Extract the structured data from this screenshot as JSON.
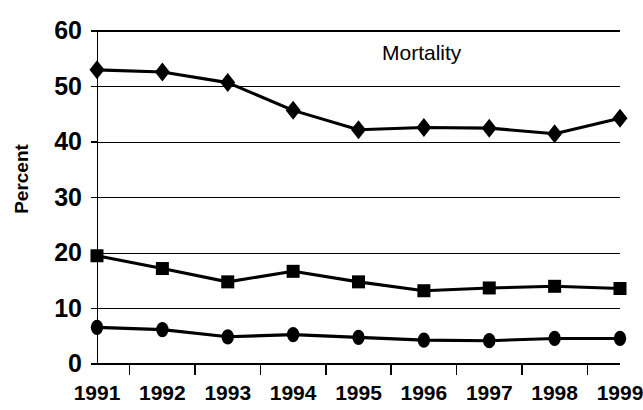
{
  "chart_data": {
    "type": "line",
    "title": "Mortality",
    "xlabel": "",
    "ylabel": "Percent",
    "categories": [
      "1991",
      "1992",
      "1993",
      "1994",
      "1995",
      "1996",
      "1997",
      "1998",
      "1999"
    ],
    "ylim": [
      0,
      60
    ],
    "yticks": [
      0,
      10,
      20,
      30,
      40,
      50,
      60
    ],
    "ytick_labels": [
      "0",
      "10",
      "20",
      "30",
      "40",
      "50",
      "60"
    ],
    "grid": true,
    "legend": "none",
    "series": [
      {
        "name": "diamond-series",
        "marker": "diamond",
        "color": "#000000",
        "values": [
          53.0,
          52.6,
          50.7,
          45.7,
          42.2,
          42.6,
          42.5,
          41.5,
          44.3
        ]
      },
      {
        "name": "square-series",
        "marker": "square",
        "color": "#000000",
        "values": [
          19.5,
          17.2,
          14.8,
          16.7,
          14.8,
          13.2,
          13.7,
          14.0,
          13.6
        ]
      },
      {
        "name": "circle-series",
        "marker": "circle",
        "color": "#000000",
        "values": [
          6.6,
          6.2,
          4.9,
          5.3,
          4.8,
          4.3,
          4.2,
          4.6,
          4.6
        ]
      }
    ]
  },
  "axis": {
    "y_title": "Percent"
  }
}
